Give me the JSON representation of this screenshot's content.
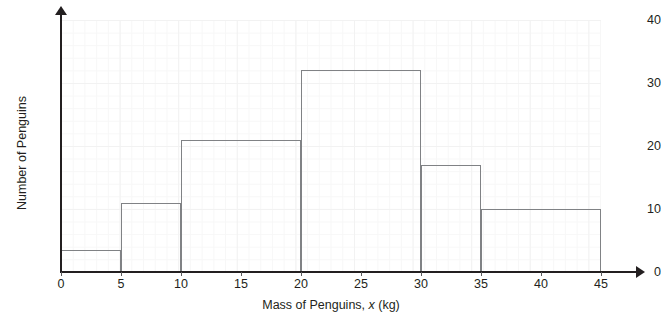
{
  "chart_data": {
    "type": "bar",
    "title": "",
    "subtitle": "",
    "xlabel_parts": {
      "before": "Mass of Penguins, ",
      "variable": "x",
      "after": " (kg)"
    },
    "xlabel": "Mass of Penguins, x (kg)",
    "ylabel": "Number of Penguins",
    "xlim": [
      0,
      45
    ],
    "ylim": [
      0,
      40
    ],
    "xticks": [
      0,
      5,
      10,
      15,
      20,
      25,
      30,
      35,
      40,
      45
    ],
    "yticks": [
      0,
      10,
      20,
      30,
      40
    ],
    "grid": true,
    "legend": false,
    "bin_edges": [
      0,
      5,
      10,
      20,
      30,
      35,
      45
    ],
    "categories": [
      "0-5",
      "5-10",
      "10-20",
      "20-30",
      "30-35",
      "35-45"
    ],
    "values": [
      3.5,
      11,
      21,
      32,
      17,
      10
    ],
    "bars": [
      {
        "label": "0-5",
        "x0": 0,
        "x1": 5,
        "value": 3.5
      },
      {
        "label": "5-10",
        "x0": 5,
        "x1": 10,
        "value": 11
      },
      {
        "label": "10-20",
        "x0": 10,
        "x1": 20,
        "value": 21
      },
      {
        "label": "20-30",
        "x0": 20,
        "x1": 30,
        "value": 32
      },
      {
        "label": "30-35",
        "x0": 30,
        "x1": 35,
        "value": 17
      },
      {
        "label": "35-45",
        "x0": 35,
        "x1": 45,
        "value": 10
      }
    ],
    "colors": {
      "background": "#ffffff",
      "axis": "#231f20",
      "bar_outline": "#808285",
      "grid_major": "#f2f2f2",
      "grid_minor": "#f7f7f7",
      "text": "#231f20"
    }
  }
}
